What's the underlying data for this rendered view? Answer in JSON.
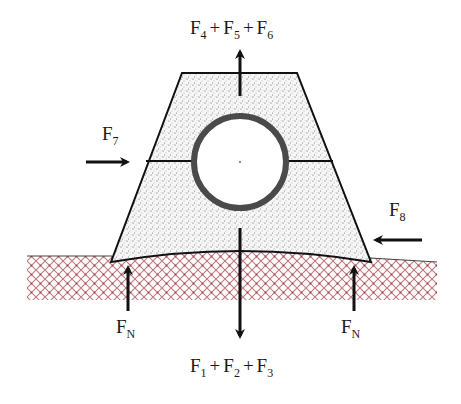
{
  "diagram": {
    "type": "free-body-diagram",
    "colors": {
      "line": "#111111",
      "fill_stipple": "#f4f4f4",
      "soil_hatch": "#b5545b",
      "pipe_ring": "#4a4a4a"
    },
    "forces": {
      "top": {
        "base": "F",
        "terms": [
          {
            "base": "F",
            "sub": "4"
          },
          {
            "base": "F",
            "sub": "5"
          },
          {
            "base": "F",
            "sub": "6"
          }
        ],
        "direction": "up"
      },
      "bottom": {
        "terms": [
          {
            "base": "F",
            "sub": "1"
          },
          {
            "base": "F",
            "sub": "2"
          },
          {
            "base": "F",
            "sub": "3"
          }
        ],
        "direction": "down"
      },
      "left": {
        "base": "F",
        "sub": "7",
        "direction": "right"
      },
      "right": {
        "base": "F",
        "sub": "8",
        "direction": "left"
      },
      "normal_left": {
        "base": "F",
        "sub": "N",
        "direction": "up"
      },
      "normal_right": {
        "base": "F",
        "sub": "N",
        "direction": "up"
      },
      "plus": "+"
    }
  }
}
